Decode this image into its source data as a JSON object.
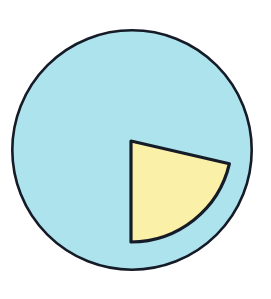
{
  "figure": {
    "title": "Pie chart with one highlighted sector",
    "background_color": "#ffffff",
    "width": 271,
    "height": 299
  },
  "chart_data": {
    "type": "pie",
    "title": "",
    "xlabel": "",
    "ylabel": "",
    "grid": false,
    "legend_position": "none",
    "labels": [
      "Shaded sector",
      "Remainder"
    ],
    "values": [
      21,
      79
    ],
    "units": "percent",
    "slice_angles_deg": [
      77,
      283
    ],
    "colors": [
      "#faf0a8",
      "#ade3ed"
    ],
    "annotations": []
  },
  "geometry": {
    "circle": {
      "center_x": 132,
      "center_y": 150,
      "radius": 121,
      "fill": "#ade3ed",
      "stroke": "#161b28",
      "stroke_width": 2.6
    },
    "sector": {
      "apex_x": 131,
      "apex_y": 141,
      "radius": 101,
      "start_angle_deg": 13,
      "end_angle_deg": 90,
      "fill": "#faf0a8",
      "stroke": "#161b28",
      "stroke_width": 3.2,
      "corner_right_x": 224,
      "corner_right_y": 164,
      "corner_left_x": 110,
      "corner_left_y": 241
    }
  },
  "palette": {
    "cyan_fill": "#ade3ed",
    "yellow_fill": "#faf0a8",
    "outline": "#161b28",
    "page_background": "#ffffff"
  }
}
